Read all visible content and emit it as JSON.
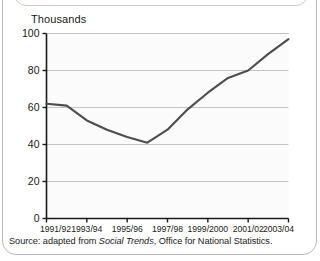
{
  "chart_data": {
    "type": "line",
    "title": "",
    "subtitle": "",
    "unit_label": "Thousands",
    "xlabel": "",
    "ylabel": "Thousands",
    "ylim": [
      0,
      100
    ],
    "yticks": [
      0,
      20,
      40,
      60,
      80,
      100
    ],
    "ytick_labels": [
      "0",
      "20",
      "40",
      "60",
      "80",
      "100"
    ],
    "grid": true,
    "grid_axis": "y",
    "legend": false,
    "legend_position": "none",
    "x": [
      "1991/92",
      "1992/93",
      "1993/94",
      "1994/95",
      "1995/96",
      "1996/97",
      "1997/98",
      "1998/99",
      "1999/2000",
      "2000/01",
      "2001/02",
      "2002/03",
      "2003/04"
    ],
    "xtick_labels": [
      "1991/92",
      "1993/94",
      "1995/96",
      "1997/98",
      "1999/2000",
      "2001/02",
      "2003/04"
    ],
    "xtick_indices": [
      0,
      2,
      4,
      6,
      8,
      10,
      12
    ],
    "values": [
      62,
      61,
      53,
      48,
      44,
      41,
      48,
      59,
      68,
      76,
      80,
      89,
      97
    ],
    "series": [
      {
        "name": "Series 1",
        "color": "#4d4d4d",
        "values": [
          62,
          61,
          53,
          48,
          44,
          41,
          48,
          59,
          68,
          76,
          80,
          89,
          97
        ]
      }
    ],
    "annotations": []
  },
  "source": {
    "prefix": "Source: adapted from ",
    "publication": "Social Trends",
    "suffix": ", Office for National Statistics."
  },
  "colors": {
    "line": "#4d4d4d",
    "axis": "#1a1a1a",
    "grid": "#c4c4c4",
    "plot_background": "#fbfbfb",
    "text": "#1a1a1a",
    "frame": "#b9b9b9"
  }
}
